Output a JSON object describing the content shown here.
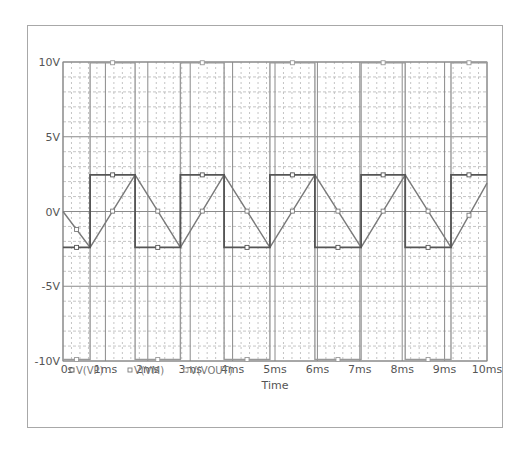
{
  "chart_data": {
    "type": "line",
    "title": "",
    "xlabel": "Time",
    "ylabel": "",
    "xlim": [
      0,
      10
    ],
    "ylim": [
      -10,
      10
    ],
    "x_unit": "ms",
    "x_ticks": [
      "0s",
      "1ms",
      "2ms",
      "3ms",
      "4ms",
      "5ms",
      "6ms",
      "7ms",
      "8ms",
      "9ms",
      "10ms"
    ],
    "y_ticks": [
      "10V",
      "5V",
      "0V",
      "-5V",
      "-10V"
    ],
    "y_tick_values": [
      10,
      5,
      0,
      -5,
      -10
    ],
    "grid": {
      "major_x_step": 1,
      "minor_x_step": 0.2,
      "major_y_step": 5,
      "minor_y_step": 1
    },
    "legend_position": "bottom-left",
    "series": [
      {
        "name": "V(VP)",
        "color": "#555555",
        "style": "square",
        "x": [
          0,
          0.64,
          0.64,
          1.7,
          1.7,
          2.77,
          2.77,
          3.8,
          3.8,
          4.88,
          4.88,
          5.94,
          5.94,
          7.03,
          7.03,
          8.07,
          8.07,
          9.15,
          9.15,
          10
        ],
        "values": [
          -2.4,
          -2.4,
          2.45,
          2.45,
          -2.4,
          -2.4,
          2.45,
          2.45,
          -2.4,
          -2.4,
          2.45,
          2.45,
          -2.4,
          -2.4,
          2.45,
          2.45,
          -2.4,
          -2.4,
          2.45,
          2.45
        ]
      },
      {
        "name": "V(VM)",
        "color": "#7a7a7a",
        "style": "triangle",
        "x": [
          0,
          0.64,
          1.7,
          2.77,
          3.8,
          4.88,
          5.94,
          7.03,
          8.07,
          9.15,
          10
        ],
        "values": [
          0,
          -2.4,
          2.45,
          -2.4,
          2.45,
          -2.4,
          2.45,
          -2.4,
          2.45,
          -2.4,
          1.9
        ]
      },
      {
        "name": "V(VOUT)",
        "color": "#9a9a9a",
        "style": "square",
        "x": [
          0,
          0.64,
          0.64,
          1.7,
          1.7,
          2.77,
          2.77,
          3.8,
          3.8,
          4.88,
          4.88,
          5.94,
          5.94,
          7.03,
          7.03,
          8.07,
          8.07,
          9.15,
          9.15,
          10
        ],
        "values": [
          -9.9,
          -9.9,
          9.95,
          9.95,
          -9.9,
          -9.9,
          9.95,
          9.95,
          -9.9,
          -9.9,
          9.95,
          9.95,
          -9.9,
          -9.9,
          9.95,
          9.95,
          -9.9,
          -9.9,
          9.95,
          9.95
        ]
      }
    ]
  },
  "legend": {
    "items": [
      {
        "label": "V(VP)",
        "color": "#555555"
      },
      {
        "label": "V(VM)",
        "color": "#7a7a7a"
      },
      {
        "label": "V(VOUT)",
        "color": "#9a9a9a"
      }
    ]
  },
  "axis": {
    "x_title": "Time"
  },
  "colors": {
    "frame": "#a8a8a8",
    "grid_major": "#8a8a8a",
    "grid_minor": "#b5b5b5",
    "text": "#555555"
  }
}
